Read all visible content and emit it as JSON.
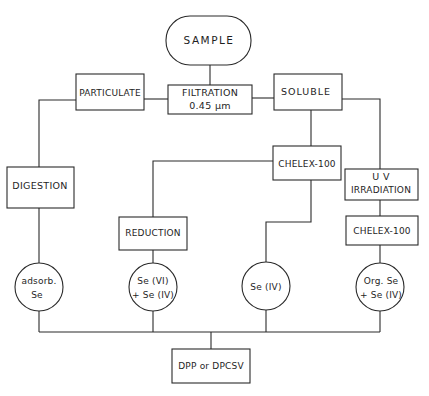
{
  "diagram": {
    "type": "flowchart",
    "nodes": {
      "sample": {
        "label": "SAMPLE",
        "shape": "rounded"
      },
      "filtration": {
        "line1": "FILTRATION",
        "line2": "0.45 µm",
        "shape": "box"
      },
      "particulate": {
        "label": "PARTICULATE",
        "shape": "box"
      },
      "soluble": {
        "label": "SOLUBLE",
        "shape": "box"
      },
      "digestion": {
        "label": "DIGESTION",
        "shape": "box"
      },
      "chelex_mid": {
        "label": "CHELEX-100",
        "shape": "box"
      },
      "uv": {
        "line1": "U V",
        "line2": "IRRADIATION",
        "shape": "box"
      },
      "reduction": {
        "label": "REDUCTION",
        "shape": "box"
      },
      "chelex_right": {
        "label": "CHELEX-100",
        "shape": "box"
      },
      "adsorb": {
        "line1": "adsorb.",
        "line2": "Se",
        "shape": "circle"
      },
      "se_vi": {
        "line1": "Se (VI)",
        "line2": "+ Se (IV)",
        "shape": "circle"
      },
      "se_iv": {
        "label": "Se (IV)",
        "shape": "circle"
      },
      "org_se": {
        "line1": "Org. Se",
        "line2": "+ Se (IV)",
        "shape": "circle"
      },
      "dpp": {
        "label": "DPP or DPCSV",
        "shape": "box"
      }
    },
    "edges": [
      [
        "sample",
        "filtration"
      ],
      [
        "filtration",
        "particulate"
      ],
      [
        "filtration",
        "soluble"
      ],
      [
        "particulate",
        "digestion"
      ],
      [
        "digestion",
        "adsorb"
      ],
      [
        "soluble",
        "chelex_mid"
      ],
      [
        "soluble",
        "uv"
      ],
      [
        "chelex_mid",
        "reduction"
      ],
      [
        "reduction",
        "se_vi"
      ],
      [
        "chelex_mid",
        "se_iv"
      ],
      [
        "uv",
        "chelex_right"
      ],
      [
        "chelex_right",
        "org_se"
      ],
      [
        "adsorb",
        "dpp"
      ],
      [
        "se_vi",
        "dpp"
      ],
      [
        "se_iv",
        "dpp"
      ],
      [
        "org_se",
        "dpp"
      ]
    ]
  }
}
